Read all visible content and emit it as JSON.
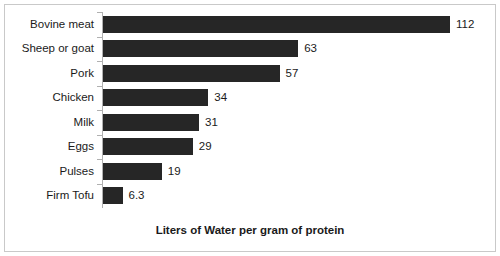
{
  "chart": {
    "background_color": "#ffffff",
    "border_color": "#c9c9c9",
    "bar_color": "#262626",
    "axis_color": "#b0b0b0"
  },
  "chart_data": {
    "type": "bar",
    "orientation": "horizontal",
    "title": "",
    "subtitle": "",
    "xlabel": "Liters of Water per gram of protein",
    "ylabel": "",
    "categories": [
      "Bovine meat",
      "Sheep or goat",
      "Pork",
      "Chicken",
      "Milk",
      "Eggs",
      "Pulses",
      "Firm Tofu"
    ],
    "values": [
      112,
      63,
      57,
      34,
      31,
      29,
      19,
      6.3
    ],
    "value_labels": [
      "112",
      "63",
      "57",
      "34",
      "31",
      "29",
      "19",
      "6.3"
    ],
    "xlim": [
      0,
      112
    ],
    "grid": false,
    "legend": false,
    "data_labels": true,
    "series": [
      {
        "name": "Liters of Water per gram of protein",
        "values": [
          112,
          63,
          57,
          34,
          31,
          29,
          19,
          6.3
        ]
      }
    ]
  }
}
